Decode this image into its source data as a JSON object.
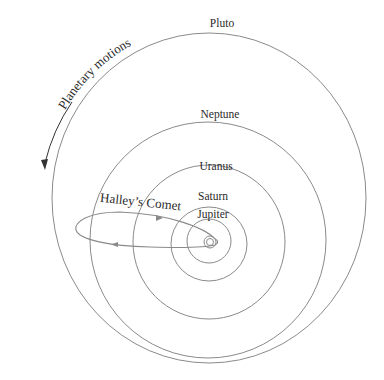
{
  "diagram": {
    "colors": {
      "orbit": "#8a8a8a",
      "text": "#2a2a2a",
      "background": "#ffffff"
    },
    "sun": {
      "cx": 210,
      "cy": 242
    },
    "orbits": [
      {
        "name": "Pluto",
        "label": "Pluto",
        "cx": 209,
        "cy": 198,
        "rx": 157,
        "ry": 165,
        "label_x": 222,
        "label_y": 27
      },
      {
        "name": "Neptune",
        "label": "Neptune",
        "cx": 208,
        "cy": 240,
        "rx": 118,
        "ry": 118,
        "label_x": 220,
        "label_y": 118
      },
      {
        "name": "Uranus",
        "label": "Uranus",
        "cx": 209,
        "cy": 242,
        "rx": 76,
        "ry": 77,
        "label_x": 216,
        "label_y": 170
      },
      {
        "name": "Saturn",
        "label": "Saturn",
        "cx": 209,
        "cy": 244,
        "rx": 38,
        "ry": 37,
        "label_x": 213,
        "label_y": 200
      },
      {
        "name": "Jupiter",
        "label": "Jupiter",
        "cx": 209,
        "cy": 241,
        "rx": 22,
        "ry": 22,
        "label_x": 213,
        "label_y": 218
      },
      {
        "name": "Mars",
        "label": "",
        "cx": 210,
        "cy": 242,
        "rx": 6,
        "ry": 6
      },
      {
        "name": "Earth",
        "label": "",
        "cx": 210,
        "cy": 242,
        "rx": 3.5,
        "ry": 3.5
      }
    ],
    "comet": {
      "label": "Halley’s Comet"
    },
    "motion": {
      "label": "Planetary motions"
    }
  }
}
